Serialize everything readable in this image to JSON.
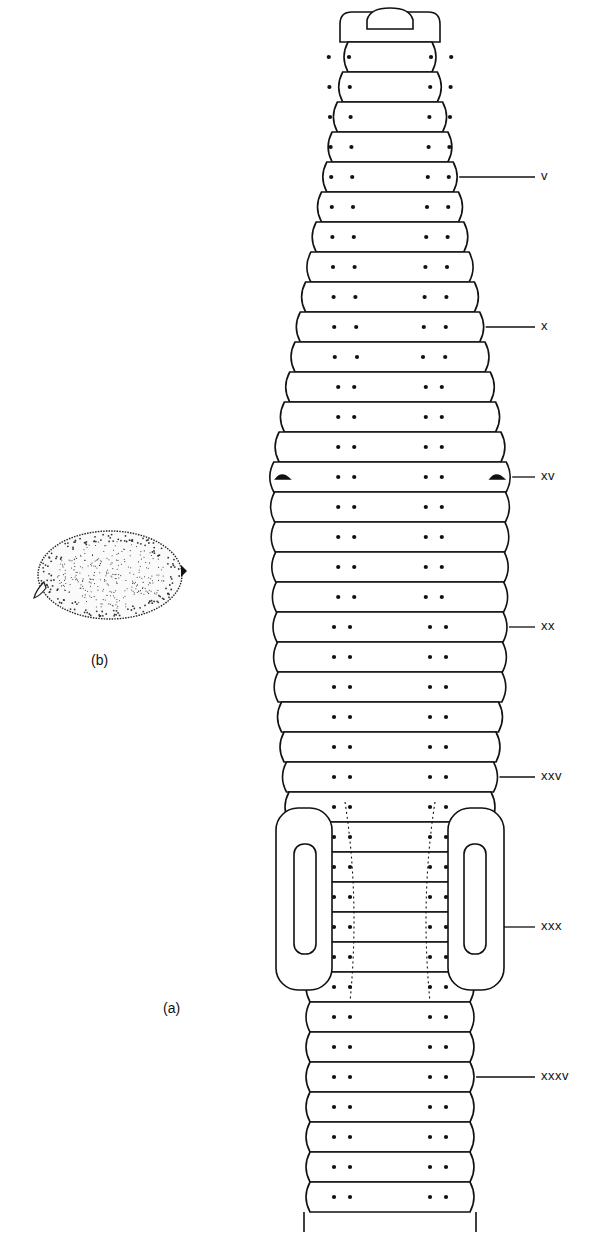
{
  "figure": {
    "panel_a_label": "(a)",
    "panel_b_label": "(b)",
    "panel_a_subject": "earthworm-ventral-view",
    "panel_b_subject": "cocoon",
    "segment_labels": [
      {
        "text": "V",
        "segment": 5
      },
      {
        "text": "X",
        "segment": 10
      },
      {
        "text": "XV",
        "segment": 15
      },
      {
        "text": "XX",
        "segment": 20
      },
      {
        "text": "XXV",
        "segment": 25
      },
      {
        "text": "XXX",
        "segment": 30
      },
      {
        "text": "XXXV",
        "segment": 35
      }
    ],
    "clitellum_segments": [
      27,
      32
    ],
    "male_pores_segment": 15,
    "total_segments_drawn": 39,
    "line_color": "#111111",
    "background": "#ffffff"
  }
}
